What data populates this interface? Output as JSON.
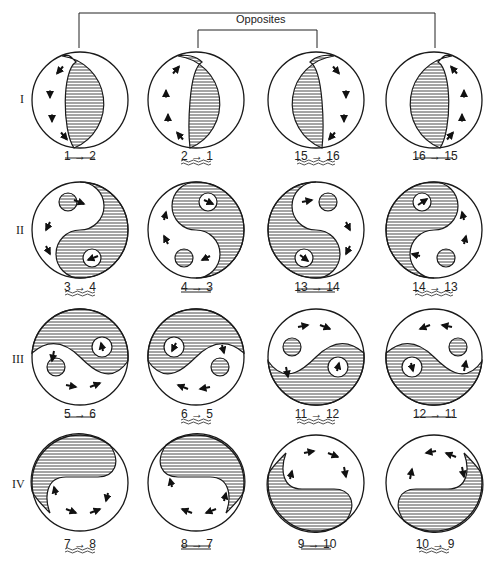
{
  "figure": {
    "bracket_label": "Opposites",
    "rows": [
      {
        "roman": "I",
        "cells": [
          {
            "label": "1 → 2",
            "underline": "single"
          },
          {
            "label": "2 → 1",
            "underline": "wavy"
          },
          {
            "label": "15 → 16",
            "underline": "wavy"
          },
          {
            "label": "16 → 15",
            "underline": "single"
          }
        ]
      },
      {
        "roman": "II",
        "cells": [
          {
            "label": "3 → 4",
            "underline": "wavy"
          },
          {
            "label": "4 → 3",
            "underline": "double"
          },
          {
            "label": "13 → 14",
            "underline": "double"
          },
          {
            "label": "14 → 13",
            "underline": "wavy"
          }
        ]
      },
      {
        "roman": "III",
        "cells": [
          {
            "label": "5 → 6",
            "underline": "single"
          },
          {
            "label": "6 → 5",
            "underline": "wavy"
          },
          {
            "label": "11 → 12",
            "underline": "wavy"
          },
          {
            "label": "12 → 11",
            "underline": "single"
          }
        ]
      },
      {
        "roman": "IV",
        "cells": [
          {
            "label": "7 → 8",
            "underline": "wavy"
          },
          {
            "label": "8 → 7",
            "underline": "double"
          },
          {
            "label": "9 → 10",
            "underline": "double"
          },
          {
            "label": "10 → 9",
            "underline": "wavy"
          }
        ]
      }
    ]
  },
  "colors": {
    "stroke": "#1a1a1a",
    "hatch": "#333333",
    "background": "#ffffff"
  }
}
